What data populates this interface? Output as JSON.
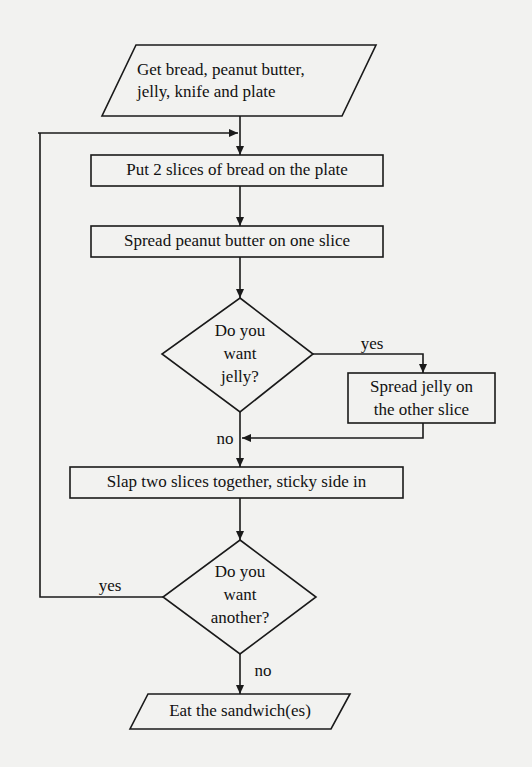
{
  "flowchart": {
    "start": {
      "line1": "Get bread, peanut butter,",
      "line2": "jelly, knife and plate"
    },
    "step1": "Put 2 slices of bread on the plate",
    "step2": "Spread peanut butter on one slice",
    "decision1": {
      "line1": "Do you",
      "line2": "want",
      "line3": "jelly?"
    },
    "decision1_yes": "yes",
    "decision1_no": "no",
    "jelly_step": {
      "line1": "Spread jelly on",
      "line2": "the other slice"
    },
    "step3": "Slap two slices together, sticky side in",
    "decision2": {
      "line1": "Do you",
      "line2": "want",
      "line3": "another?"
    },
    "decision2_yes": "yes",
    "decision2_no": "no",
    "end": "Eat the sandwich(es)"
  },
  "colors": {
    "background": "#f2f2f0",
    "stroke": "#1a1a1a",
    "text": "#111111"
  }
}
